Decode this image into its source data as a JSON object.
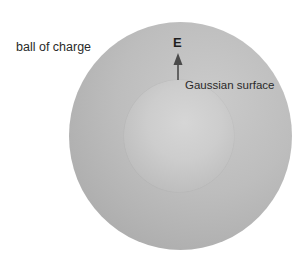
{
  "diagram": {
    "labels": {
      "ball": "ball of charge",
      "gaussian_surface": "Gaussian surface",
      "field_vector": "E"
    },
    "shapes": {
      "outer_sphere": {
        "name": "ball of charge",
        "center": [
          180,
          136
        ],
        "radius": 112,
        "color_light": "#cbcbcb",
        "color_dark": "#a3a3a3"
      },
      "inner_sphere": {
        "name": "Gaussian surface",
        "center": [
          179,
          136
        ],
        "radius": 55,
        "color_light": "#d6d6d6",
        "color_dark": "#b2b2b2"
      },
      "arrow": {
        "direction": "up",
        "from": [
          178,
          80
        ],
        "to": [
          178,
          54
        ],
        "color": "#4a4a4a"
      }
    },
    "colors": {
      "background": "#ffffff",
      "text": "#2a2a2a"
    }
  }
}
